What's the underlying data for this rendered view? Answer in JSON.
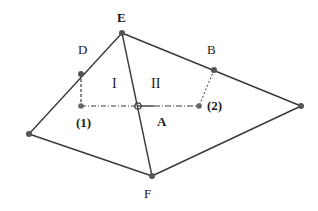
{
  "diagram": {
    "colors": {
      "line": "#3a3a3a",
      "point": "#555555",
      "text": "#1a1a1a"
    },
    "labels": {
      "E": "E",
      "D": "D",
      "B": "B",
      "F": "F",
      "A": "A",
      "p1": "(1)",
      "p2": "(2)",
      "regionI": "I",
      "regionII": "II"
    },
    "points": {
      "E": [
        122,
        33
      ],
      "D": [
        81,
        74
      ],
      "B": [
        214,
        70
      ],
      "Left": [
        29,
        134
      ],
      "Right": [
        301,
        106
      ],
      "F": [
        152,
        176
      ],
      "p1": [
        81,
        106
      ],
      "A": [
        138,
        106
      ],
      "p2": [
        199,
        106
      ]
    },
    "edges": {
      "solid": [
        [
          "Left",
          "E"
        ],
        [
          "E",
          "Right"
        ],
        [
          "Right",
          "F"
        ],
        [
          "F",
          "Left"
        ],
        [
          "E",
          "F"
        ],
        [
          "A",
          "p2_half"
        ]
      ],
      "dashed": [
        [
          "D",
          "p1"
        ],
        [
          "B",
          "p2"
        ]
      ],
      "dashdot": [
        [
          "p1",
          "A"
        ],
        [
          "A",
          "p2"
        ]
      ]
    }
  }
}
